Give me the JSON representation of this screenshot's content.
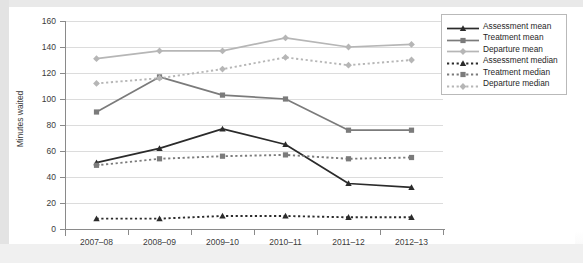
{
  "chart": {
    "ylabel": "Minutes waited",
    "yticks": [
      0,
      20,
      40,
      60,
      80,
      100,
      120,
      140,
      160
    ],
    "xticks": [
      "2007–08",
      "2008–09",
      "2009–10",
      "2010–11",
      "2011–12",
      "2012–13"
    ]
  },
  "legend": {
    "items": [
      {
        "label": "Assessment mean",
        "color": "#2b2b2b",
        "dash": "solid",
        "marker": "triangle"
      },
      {
        "label": "Treatment mean",
        "color": "#7b7b7b",
        "dash": "solid",
        "marker": "square"
      },
      {
        "label": "Departure mean",
        "color": "#b6b6b6",
        "dash": "solid",
        "marker": "diamond"
      },
      {
        "label": "Assessment median",
        "color": "#2b2b2b",
        "dash": "dotted",
        "marker": "triangle"
      },
      {
        "label": "Treatment median",
        "color": "#7b7b7b",
        "dash": "dotted",
        "marker": "square"
      },
      {
        "label": "Departure median",
        "color": "#b6b6b6",
        "dash": "dotted",
        "marker": "diamond"
      }
    ]
  },
  "chart_data": {
    "type": "line",
    "title": "",
    "xlabel": "",
    "ylabel": "Minutes waited",
    "categories": [
      "2007–08",
      "2008–09",
      "2009–10",
      "2010–11",
      "2011–12",
      "2012–13"
    ],
    "ylim": [
      0,
      160
    ],
    "ytick_step": 20,
    "grid": "horizontal",
    "legend_position": "right",
    "series": [
      {
        "name": "Assessment mean",
        "values": [
          51,
          62,
          77,
          65,
          35,
          32
        ],
        "color": "#2b2b2b",
        "dash": "solid",
        "marker": "triangle"
      },
      {
        "name": "Treatment mean",
        "values": [
          90,
          117,
          103,
          100,
          76,
          76
        ],
        "color": "#7b7b7b",
        "dash": "solid",
        "marker": "square"
      },
      {
        "name": "Departure mean",
        "values": [
          131,
          137,
          137,
          147,
          140,
          142
        ],
        "color": "#b6b6b6",
        "dash": "solid",
        "marker": "diamond"
      },
      {
        "name": "Assessment median",
        "values": [
          8,
          8,
          10,
          10,
          9,
          9
        ],
        "color": "#2b2b2b",
        "dash": "dotted",
        "marker": "triangle"
      },
      {
        "name": "Treatment median",
        "values": [
          49,
          54,
          56,
          57,
          54,
          55
        ],
        "color": "#7b7b7b",
        "dash": "dotted",
        "marker": "square"
      },
      {
        "name": "Departure median",
        "values": [
          112,
          116,
          123,
          132,
          126,
          130
        ],
        "color": "#b6b6b6",
        "dash": "dotted",
        "marker": "diamond"
      }
    ]
  },
  "bottom_caption": ""
}
